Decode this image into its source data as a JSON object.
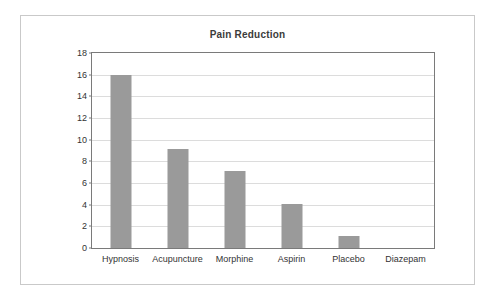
{
  "chart_data": {
    "type": "bar",
    "title": "Pain Reduction",
    "xlabel": "",
    "ylabel": "",
    "categories": [
      "Hypnosis",
      "Acupuncture",
      "Morphine",
      "Aspirin",
      "Placebo",
      "Diazepam"
    ],
    "values": [
      16,
      9.1,
      7.1,
      4.1,
      1.1,
      0
    ],
    "ylim": [
      0,
      18
    ],
    "ytick_labels": [
      "0",
      "2",
      "4",
      "6",
      "8",
      "10",
      "12",
      "14",
      "16",
      "18"
    ],
    "ytick_values": [
      0,
      2,
      4,
      6,
      8,
      10,
      12,
      14,
      16,
      18
    ],
    "grid": true,
    "legend": "none",
    "bar_color": "#9a9a9a",
    "gridline_color": "#dcdcdc",
    "axis_color": "#7a7a7a",
    "frame_color": "#c9c9c9",
    "text_color": "#333333",
    "title_color": "#3b3b3b"
  }
}
